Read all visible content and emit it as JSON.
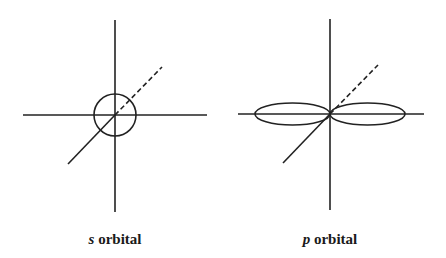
{
  "diagrams": [
    {
      "name": "s-orbital",
      "label_italic": "s",
      "label_rest": " orbital",
      "center": [
        115,
        115
      ],
      "shape": "sphere",
      "radius": 21
    },
    {
      "name": "p-orbital",
      "label_italic": "p",
      "label_rest": " orbital",
      "center": [
        330,
        114
      ],
      "shape": "dumbbell",
      "lobe_rx": 37.5,
      "lobe_ry": 11
    }
  ],
  "colors": {
    "stroke": "#222222",
    "background": "#ffffff"
  }
}
